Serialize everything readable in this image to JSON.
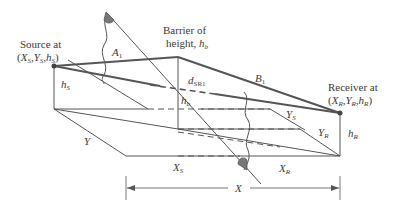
{
  "diagram": {
    "type": "barrier-geometry",
    "labels": {
      "source_line1": "Source at",
      "source_line2_open": "(",
      "source_X": "X",
      "source_X_sub": "S",
      "source_Y": "Y",
      "source_Y_sub": "S",
      "source_h": "h",
      "source_h_sub": "S",
      "source_line2_close": ")",
      "barrier_line1": "Barrier of",
      "barrier_line2": "height, ",
      "barrier_h": "h",
      "barrier_h_sub": "b",
      "receiver_line1": "Receiver at",
      "receiver_X": "X",
      "receiver_X_sub": "R",
      "receiver_Y": "Y",
      "receiver_Y_sub": "R",
      "receiver_h": "h",
      "receiver_h_sub": "R",
      "A1": "A",
      "A1_sub": "1",
      "B1": "B",
      "B1_sub": "1",
      "dSR1": "d",
      "dSR1_sub": "SR1",
      "hS": "h",
      "hS_sub": "S",
      "hb": "h",
      "hb_sub": "b",
      "hR": "h",
      "hR_sub": "R",
      "Y": "Y",
      "YS": "Y",
      "YS_sub": "S",
      "YR": "Y",
      "YR_sub": "R",
      "XS": "X",
      "XS_sub": "S",
      "XR": "X",
      "XR_sub": "R",
      "X": "X",
      "comma": ","
    },
    "colors": {
      "line": "#4a4a4a",
      "text": "#3a3a3a"
    }
  }
}
